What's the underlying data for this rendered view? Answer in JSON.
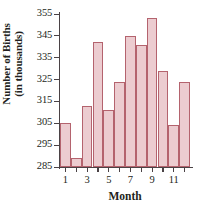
{
  "chart_data": {
    "type": "bar",
    "title": "",
    "xlabel": "Month",
    "ylabel": "Number of Births (in thousands)",
    "ylabel_lines": [
      "Number of Births",
      "(in thousands)"
    ],
    "categories": [
      "1",
      "2",
      "3",
      "4",
      "5",
      "6",
      "7",
      "8",
      "9",
      "10",
      "11",
      "12"
    ],
    "values": [
      305,
      289,
      313,
      342,
      311,
      324,
      345,
      341,
      353,
      329,
      304,
      324
    ],
    "xtick_labels": [
      "1",
      "3",
      "5",
      "7",
      "9",
      "11"
    ],
    "xtick_positions": [
      1,
      3,
      5,
      7,
      9,
      11
    ],
    "ytick_labels": [
      "285",
      "295",
      "305",
      "315",
      "325",
      "335",
      "345",
      "355"
    ],
    "ytick_values": [
      285,
      295,
      305,
      315,
      325,
      335,
      345,
      355
    ],
    "ylim": [
      285,
      355
    ],
    "xlim": [
      0.5,
      12.5
    ],
    "grid": false,
    "legend": null,
    "bar_fill_color": "#ecccd0",
    "bar_edge_color": "#b4636e",
    "axis_color": "#4a4245",
    "text_color": "#231f20",
    "background_color": "#ffffff"
  }
}
